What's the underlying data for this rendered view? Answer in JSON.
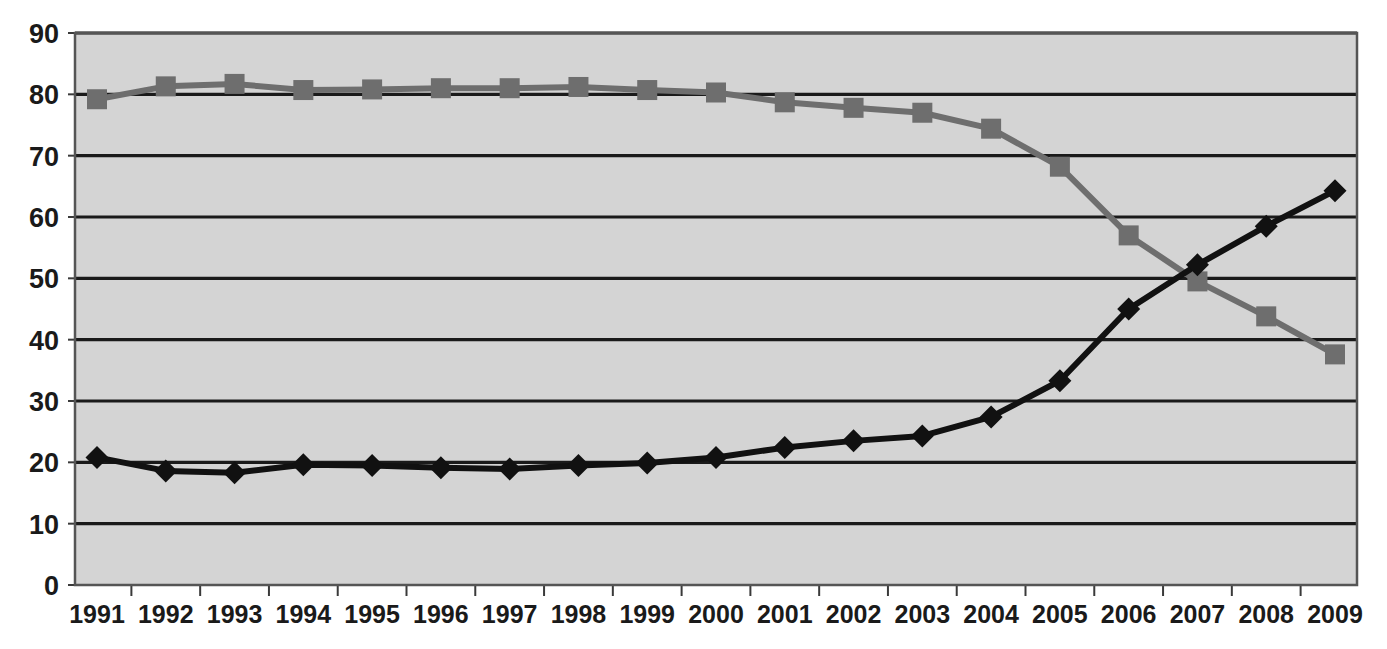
{
  "chart_data": {
    "type": "line",
    "title": "",
    "subtitle": "",
    "xlabel": "",
    "ylabel": "",
    "grid": true,
    "legend_position": "none",
    "xlim": [
      1991,
      2009
    ],
    "ylim": [
      0,
      90
    ],
    "ytick_step": 10,
    "categories": [
      "1991",
      "1992",
      "1993",
      "1994",
      "1995",
      "1996",
      "1997",
      "1998",
      "1999",
      "2000",
      "2001",
      "2002",
      "2003",
      "2004",
      "2005",
      "2006",
      "2007",
      "2008",
      "2009"
    ],
    "xticks": [
      "1991",
      "1992",
      "1993",
      "1994",
      "1995",
      "1996",
      "1997",
      "1998",
      "1999",
      "2000",
      "2001",
      "2002",
      "2003",
      "2004",
      "2005",
      "2006",
      "2007",
      "2008",
      "2009"
    ],
    "yticks": [
      "0",
      "10",
      "20",
      "30",
      "40",
      "50",
      "60",
      "70",
      "80",
      "90"
    ],
    "series": [
      {
        "name": "series-squares-declining",
        "marker": "square",
        "color": "#6e6e6e",
        "line_color": "#6e6e6e",
        "values": [
          79.2,
          81.3,
          81.7,
          80.7,
          80.8,
          81.0,
          81.0,
          81.2,
          80.7,
          80.3,
          78.7,
          77.8,
          77.0,
          74.4,
          68.2,
          57.0,
          49.5,
          43.8,
          37.6
        ]
      },
      {
        "name": "series-diamonds-rising",
        "marker": "diamond",
        "color": "#111111",
        "line_color": "#111111",
        "values": [
          20.8,
          18.6,
          18.3,
          19.6,
          19.5,
          19.1,
          18.9,
          19.5,
          19.9,
          20.8,
          22.4,
          23.5,
          24.3,
          27.4,
          33.3,
          45.0,
          52.2,
          58.5,
          64.3
        ]
      }
    ],
    "colors": {
      "plot_background": "#d4d4d4",
      "gridline": "#1a1a1a",
      "axis": "#3a3a3a",
      "page_background": "#ffffff",
      "series_1": "#6e6e6e",
      "series_2": "#111111"
    }
  }
}
